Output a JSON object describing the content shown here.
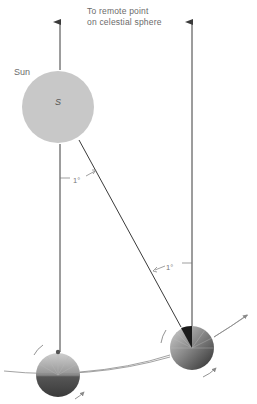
{
  "diagram": {
    "caption_line1": "To remote point",
    "caption_line2": "on celestial sphere",
    "sun_label": "Sun",
    "sun_letter": "S",
    "angle_labels": [
      "1°",
      "1°"
    ],
    "colors": {
      "sun_fill": "#c8c8c8",
      "line": "#3a3a3a",
      "orbit": "#8a8a8a",
      "planet_dark": "#2a2a2a",
      "planet_light": "#bdbdbd"
    },
    "elements": {
      "sun": {
        "cx": 58,
        "cy": 107,
        "r": 36
      },
      "planet_left": {
        "cx": 58,
        "cy": 375,
        "r": 22
      },
      "planet_right": {
        "cx": 192,
        "cy": 348,
        "r": 22
      },
      "line_to_remote_left_x": 60,
      "line_to_remote_right_x": 192
    }
  }
}
